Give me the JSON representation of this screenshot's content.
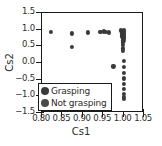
{
  "chart_data": {
    "type": "scatter",
    "title": "",
    "xlabel": "Cs1",
    "ylabel": "Cs2",
    "xlim": [
      0.8,
      1.05
    ],
    "ylim": [
      -1.5,
      1.5
    ],
    "xticks": [
      "0.80",
      "0.85",
      "0.90",
      "0.95",
      "1.00",
      "1.05"
    ],
    "xtick_values": [
      0.8,
      0.85,
      0.9,
      0.95,
      1.0,
      1.05
    ],
    "yticks": [
      "1.5",
      "1.0",
      "0.5",
      "0.0",
      "−0.5",
      "−1.0",
      "−1.5"
    ],
    "ytick_values": [
      1.5,
      1.0,
      0.5,
      0.0,
      -0.5,
      -1.0,
      -1.5
    ],
    "grid": false,
    "legend_position": "lower left",
    "marker_color": "#3a3a3a",
    "axis_color": "#1a1a1a",
    "background": "#ffffff",
    "series": [
      {
        "name": "Grasping",
        "color": "#3a3a3a",
        "marker": "circle",
        "points": [
          [
            0.822,
            0.93
          ],
          [
            0.873,
            0.89
          ],
          [
            0.873,
            0.49
          ],
          [
            0.913,
            0.92
          ],
          [
            0.943,
            0.93
          ],
          [
            0.951,
            0.95
          ],
          [
            0.957,
            0.93
          ],
          [
            0.963,
            0.92
          ],
          [
            0.975,
            -0.1
          ],
          [
            0.993,
            0.98
          ],
          [
            0.995,
            0.95
          ],
          [
            0.996,
            0.9
          ],
          [
            0.997,
            0.86
          ],
          [
            0.997,
            0.8
          ],
          [
            0.998,
            0.74
          ],
          [
            0.998,
            0.68
          ],
          [
            0.999,
            0.62
          ],
          [
            0.999,
            0.55
          ],
          [
            0.999,
            0.44
          ],
          [
            0.998,
            0.36
          ],
          [
            1.0,
            0.99
          ],
          [
            1.0,
            0.96
          ],
          [
            1.0,
            0.93
          ],
          [
            1.0,
            0.9
          ],
          [
            1.0,
            0.87
          ],
          [
            1.0,
            0.84
          ],
          [
            1.0,
            0.8
          ],
          [
            1.0,
            0.76
          ],
          [
            1.0,
            0.72
          ],
          [
            1.0,
            0.66
          ]
        ]
      },
      {
        "name": "Not grasping",
        "color": "#3a3a3a",
        "marker": "circle",
        "points": [
          [
            1.0,
            0.06
          ],
          [
            1.0,
            -0.12
          ],
          [
            1.0,
            -0.3
          ],
          [
            1.0,
            -0.46
          ],
          [
            1.0,
            -0.62
          ],
          [
            1.0,
            -0.78
          ],
          [
            1.0,
            -0.93
          ],
          [
            1.0,
            -1.01
          ],
          [
            1.0,
            -1.07
          ]
        ]
      }
    ]
  },
  "legend": {
    "items": [
      {
        "label": "Grasping",
        "color": "#3a3a3a"
      },
      {
        "label": "Not grasping",
        "color": "#4a4a4a"
      }
    ]
  }
}
